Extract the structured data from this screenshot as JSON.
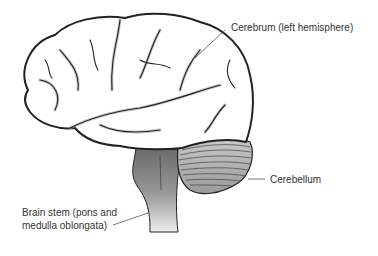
{
  "diagram": {
    "labels": [
      {
        "id": "cerebrum",
        "text": "Cerebrum (left hemisphere)"
      },
      {
        "id": "cerebellum",
        "text": "Cerebellum"
      },
      {
        "id": "brainstem",
        "line1": "Brain stem (pons and",
        "line2": "medulla oblongata)"
      }
    ],
    "colors": {
      "outline": "#222222",
      "cerebrum_fill": "#ffffff",
      "sulci_shadow": "#9a9a9a",
      "cerebellum_fill": "#b8b8b8",
      "brainstem_dark": "#6a6a6a",
      "brainstem_light": "#e6e6e6",
      "leader_line": "#555555",
      "text": "#333333"
    }
  }
}
